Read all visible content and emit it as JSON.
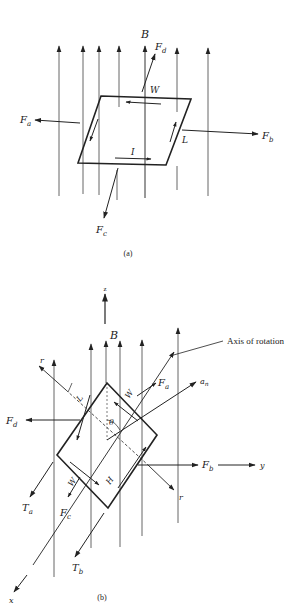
{
  "figure_a": {
    "caption": "(a)",
    "labels": {
      "B": "B",
      "Fa": "F",
      "Fa_sub": "a",
      "Fb": "F",
      "Fb_sub": "b",
      "Fc": "F",
      "Fc_sub": "c",
      "Fd": "F",
      "Fd_sub": "d",
      "W": "W",
      "L": "L",
      "I": "I"
    }
  },
  "figure_b": {
    "caption": "(b)",
    "labels": {
      "z": "z",
      "x": "x",
      "y": "y",
      "B": "B",
      "axis_of_rotation": "Axis of rotation",
      "Fa": "F",
      "Fa_sub": "a",
      "Fb": "F",
      "Fb_sub": "b",
      "Fc": "F",
      "Fc_sub": "c",
      "Fd": "F",
      "Fd_sub": "d",
      "an": "a",
      "an_sub": "n",
      "r_top": "r",
      "r_bottom": "r",
      "L": "L",
      "W_top": "W",
      "W_bottom": "W",
      "H": "H",
      "theta": "θ",
      "Ta": "T",
      "Ta_sub": "a",
      "Tb": "T",
      "Tb_sub": "b"
    }
  },
  "colors": {
    "line": "#222222",
    "field_line": "#555555"
  }
}
